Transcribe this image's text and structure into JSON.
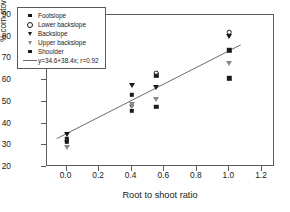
{
  "chart_data": {
    "type": "scatter",
    "title": "",
    "xlabel": "Root to shoot ratio",
    "ylabel": "% corn stover that can be removed",
    "xlim": [
      -0.12,
      1.28
    ],
    "ylim": [
      20,
      90
    ],
    "xticks": [
      "0.0",
      "0.2",
      "0.4",
      "0.6",
      "0.8",
      "1.0",
      "1.2"
    ],
    "xtick_values": [
      0.0,
      0.2,
      0.4,
      0.6,
      0.8,
      1.0,
      1.2
    ],
    "yticks": [
      "20",
      "30",
      "40",
      "50",
      "60",
      "70",
      "80",
      "90"
    ],
    "ytick_values": [
      20,
      30,
      40,
      50,
      60,
      70,
      80,
      90
    ],
    "grid": false,
    "legend_position": "top-left",
    "series": [
      {
        "name": "Footslope",
        "marker": "square-filled",
        "color": "#1a1a1a",
        "points": [
          {
            "x": 0.0,
            "y": 33.0
          },
          {
            "x": 0.4,
            "y": 53.2
          },
          {
            "x": 0.55,
            "y": 62.2
          },
          {
            "x": 1.0,
            "y": 73.8
          }
        ]
      },
      {
        "name": "Lower backslope",
        "marker": "circle-open",
        "color": "#1a1a1a",
        "points": [
          {
            "x": 0.0,
            "y": 32.0
          },
          {
            "x": 0.4,
            "y": 48.4
          },
          {
            "x": 0.55,
            "y": 63.4
          },
          {
            "x": 1.0,
            "y": 82.0
          }
        ]
      },
      {
        "name": "Backslope",
        "marker": "triangle-filled",
        "color": "#1a1a1a",
        "points": [
          {
            "x": 0.0,
            "y": 35.4
          },
          {
            "x": 0.4,
            "y": 57.6
          },
          {
            "x": 0.55,
            "y": 57.0
          },
          {
            "x": 1.0,
            "y": 80.1
          }
        ]
      },
      {
        "name": "Upper backslope",
        "marker": "triangle-open",
        "color": "#8a8a8a",
        "points": [
          {
            "x": 0.0,
            "y": 29.2
          },
          {
            "x": 0.4,
            "y": 49.2
          },
          {
            "x": 0.55,
            "y": 51.2
          },
          {
            "x": 1.0,
            "y": 67.8
          }
        ]
      },
      {
        "name": "Shoulder",
        "marker": "square-filled",
        "color": "#1a1a1a",
        "points": [
          {
            "x": 0.0,
            "y": 31.6
          },
          {
            "x": 0.4,
            "y": 45.9
          },
          {
            "x": 0.55,
            "y": 47.8
          },
          {
            "x": 1.0,
            "y": 60.8
          }
        ]
      }
    ],
    "fit": {
      "label": "y=34.6+38.4x; r=0.92",
      "intercept": 34.6,
      "slope": 38.4,
      "r": 0.92,
      "x_start": -0.06,
      "x_end": 1.08,
      "color": "#6a6a6a"
    }
  },
  "legend": {
    "entries": [
      {
        "label": "Footslope",
        "key": "square-filled"
      },
      {
        "label": "Lower backslope",
        "key": "circle-open"
      },
      {
        "label": "Backslope",
        "key": "triangle-filled"
      },
      {
        "label": "Upper backslope",
        "key": "triangle-open"
      },
      {
        "label": "Shoulder",
        "key": "square-filled"
      },
      {
        "label": "y=34.6+38.4x; r=0.92",
        "key": "line"
      }
    ]
  }
}
